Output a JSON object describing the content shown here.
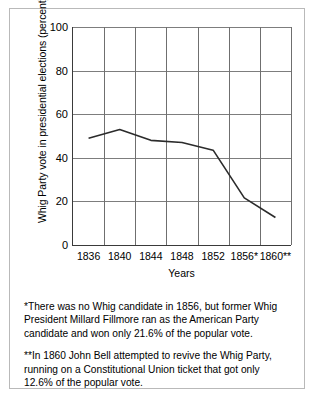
{
  "chart_data": {
    "type": "line",
    "title": "",
    "xlabel": "Years",
    "ylabel": "Whig Party vote in presidential elections (percent)",
    "categories": [
      "1836",
      "1840",
      "1844",
      "1848",
      "1852",
      "1856*",
      "1860**"
    ],
    "x": [
      1836,
      1840,
      1844,
      1848,
      1852,
      1856,
      1860
    ],
    "values": [
      49,
      53,
      48,
      47,
      43.5,
      21.6,
      12.6
    ],
    "series": [
      {
        "name": "Whig Party vote",
        "values": [
          49,
          53,
          48,
          47,
          43.5,
          21.6,
          12.6
        ]
      }
    ],
    "ylim": [
      0,
      100
    ],
    "yticks": [
      0,
      20,
      40,
      60,
      80,
      100
    ],
    "ytick_labels": [
      "0",
      "20",
      "40",
      "60",
      "80",
      "100"
    ],
    "grid": "both",
    "legend": "none",
    "line_color": "#2b2b2b",
    "grid_color": "#7d7d7d",
    "axis_color": "#3a3a3a"
  },
  "footnotes": [
    "*There was no Whig candidate in 1856, but former Whig President Millard Fillmore ran as the American Party candidate and won only 21.6% of the popular vote.",
    "**In 1860 John Bell attempted to revive the Whig Party, running on a Constitutional Union ticket that got only 12.6% of the popular vote."
  ]
}
